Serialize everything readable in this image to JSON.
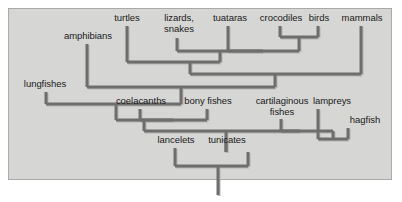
{
  "figure": {
    "kind": "cladogram",
    "title": "",
    "panel": {
      "background_color": "#d6d6d4",
      "border_color": "#aaaaa8",
      "x": 8,
      "y": 8,
      "width": 384,
      "height": 172
    },
    "branch_color": "#6e6e6e",
    "branch_shadow_color": "#b4b4b2",
    "branch_width": 3
  },
  "taxa": [
    {
      "id": "turtles",
      "label": "turtles",
      "x": 127,
      "label_x": 127,
      "label_y": 13,
      "tip_y": 26
    },
    {
      "id": "lizards",
      "label": "lizards,\nsnakes",
      "x": 177,
      "label_x": 179,
      "label_y": 13,
      "tip_y": 38
    },
    {
      "id": "tuataras",
      "label": "tuataras",
      "x": 228,
      "label_x": 230,
      "label_y": 13,
      "tip_y": 26
    },
    {
      "id": "crocodiles",
      "label": "crocodiles",
      "x": 280,
      "label_x": 281,
      "label_y": 13,
      "tip_y": 26
    },
    {
      "id": "birds",
      "label": "birds",
      "x": 318,
      "label_x": 319,
      "label_y": 13,
      "tip_y": 26
    },
    {
      "id": "mammals",
      "label": "mammals",
      "x": 361,
      "label_x": 362,
      "label_y": 13,
      "tip_y": 26
    },
    {
      "id": "amphibians",
      "label": "amphibians",
      "x": 87,
      "label_x": 88,
      "label_y": 31,
      "tip_y": 44
    },
    {
      "id": "lungfishes",
      "label": "lungfishes",
      "x": 46,
      "label_x": 45,
      "label_y": 79,
      "tip_y": 92
    },
    {
      "id": "coelacanths",
      "label": "coelacanths",
      "x": 140,
      "label_x": 141,
      "label_y": 96,
      "tip_y": 109
    },
    {
      "id": "bony-fishes",
      "label": "bony fishes",
      "x": 207,
      "label_x": 208,
      "label_y": 96,
      "tip_y": 109
    },
    {
      "id": "cartilaginous",
      "label": "cartilaginous\nfishes",
      "x": 281,
      "label_x": 282,
      "label_y": 96,
      "tip_y": 119
    },
    {
      "id": "lampreys",
      "label": "lampreys",
      "x": 318,
      "label_x": 332,
      "label_y": 96,
      "tip_y": 109
    },
    {
      "id": "hagfish",
      "label": "hagfish",
      "x": 348,
      "label_x": 365,
      "label_y": 115,
      "tip_y": 128
    },
    {
      "id": "lancelets",
      "label": "lancelets",
      "x": 175,
      "label_x": 176,
      "label_y": 135,
      "tip_y": 148
    },
    {
      "id": "tunicates",
      "label": "tunicates",
      "x": 226,
      "label_x": 227,
      "label_y": 135,
      "tip_y": 141
    }
  ],
  "nodes": [
    {
      "id": "n-croc-birds",
      "children": [
        "crocodiles",
        "birds"
      ],
      "y": 37,
      "x": 299
    },
    {
      "id": "n-archosaur",
      "children": [
        "tuataras",
        "n-croc-birds"
      ],
      "y": 51,
      "x": 263
    },
    {
      "id": "n-reptiles",
      "children": [
        "lizards",
        "n-archosaur"
      ],
      "y": 51,
      "x": 220
    },
    {
      "id": "n-sauropsids",
      "children": [
        "turtles",
        "n-reptiles"
      ],
      "y": 62,
      "x": 190
    },
    {
      "id": "n-amniotes",
      "children": [
        "n-sauropsids",
        "mammals"
      ],
      "y": 74,
      "x": 275
    },
    {
      "id": "n-tetrapods",
      "children": [
        "amphibians",
        "n-amniotes"
      ],
      "y": 87,
      "x": 181
    },
    {
      "id": "n-coel-bony",
      "children": [
        "coelacanths",
        "bony fishes"
      ],
      "y": 120,
      "x": 173
    },
    {
      "id": "n-lungfish",
      "children": [
        "lungfishes",
        "n-tetrapods"
      ],
      "y": 104,
      "x": 116
    },
    {
      "id": "n-sarcopt",
      "children": [
        "n-lungfish",
        "n-coel-bony"
      ],
      "y": 120,
      "x": 144
    },
    {
      "id": "n-lamp-hag",
      "children": [
        "lampreys",
        "hagfish"
      ],
      "y": 139,
      "x": 333
    },
    {
      "id": "n-cyclostome",
      "children": [
        "cartilaginous",
        "n-lamp-hag"
      ],
      "y": 131,
      "x": 300
    },
    {
      "id": "n-vertebrates",
      "children": [
        "n-sarcopt",
        "n-cyclostome"
      ],
      "y": 131,
      "x": 226
    },
    {
      "id": "n-tunicates",
      "children": [
        "tunicates",
        "n-vertebrates"
      ],
      "y": 152,
      "x": 248
    },
    {
      "id": "n-chordates",
      "children": [
        "lancelets",
        "n-tunicates"
      ],
      "y": 166,
      "x": 218
    }
  ],
  "root": {
    "id": "root",
    "x": 218,
    "y_top": 166,
    "y_bottom": 195
  }
}
